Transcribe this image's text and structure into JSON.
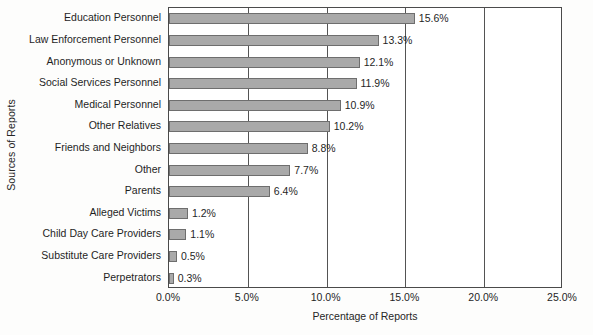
{
  "chart_data": {
    "type": "bar",
    "orientation": "horizontal",
    "title": "",
    "xlabel": "Percentage of Reports",
    "ylabel": "Sources of Reports",
    "xlim": [
      0,
      25
    ],
    "xticks": [
      "0.0%",
      "5.0%",
      "10.0%",
      "15.0%",
      "20.0%",
      "25.0%"
    ],
    "xtick_values": [
      0,
      5,
      10,
      15,
      20,
      25
    ],
    "grid": true,
    "legend": "none",
    "bar_color": "#a9a9a9",
    "bar_edge_color": "#6e6e6e",
    "frame_color": "#4a4a4a",
    "categories": [
      "Education Personnel",
      "Law Enforcement Personnel",
      "Anonymous or Unknown",
      "Social Services Personnel",
      "Medical Personnel",
      "Other Relatives",
      "Friends and Neighbors",
      "Other",
      "Parents",
      "Alleged Victims",
      "Child Day Care Providers",
      "Substitute Care Providers",
      "Perpetrators"
    ],
    "values": [
      15.6,
      13.3,
      12.1,
      11.9,
      10.9,
      10.2,
      8.8,
      7.7,
      6.4,
      1.2,
      1.1,
      0.5,
      0.3
    ],
    "value_labels": [
      "15.6%",
      "13.3%",
      "12.1%",
      "11.9%",
      "10.9%",
      "10.2%",
      "8.8%",
      "7.7%",
      "6.4%",
      "1.2%",
      "1.1%",
      "0.5%",
      "0.3%"
    ]
  }
}
